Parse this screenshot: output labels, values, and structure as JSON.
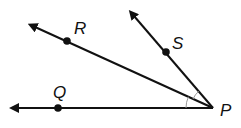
{
  "diagram": {
    "type": "geometry-angles",
    "vertex": {
      "label": "P",
      "x": 213,
      "y": 108
    },
    "rays": [
      {
        "name": "ray-PQ",
        "point_label": "Q",
        "point": [
          58,
          108
        ],
        "tip": [
          13,
          108
        ]
      },
      {
        "name": "ray-PR",
        "point_label": "R",
        "point": [
          67,
          41
        ],
        "tip": [
          31,
          25
        ]
      },
      {
        "name": "ray-PS",
        "point_label": "S",
        "point": [
          166,
          52
        ],
        "tip": [
          131,
          12
        ]
      }
    ],
    "labels": {
      "P": "P",
      "Q": "Q",
      "R": "R",
      "S": "S"
    },
    "angle_marks": [
      "angle-QPR",
      "angle-RPS"
    ],
    "colors": {
      "line": "#111111",
      "arc": "#999999"
    }
  }
}
